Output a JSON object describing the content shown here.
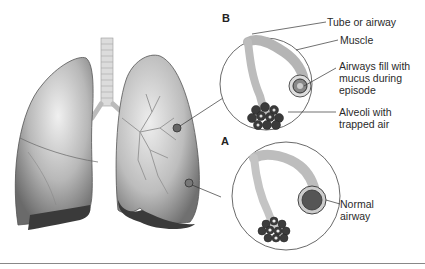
{
  "diagram": {
    "panels": [
      {
        "id": "B",
        "letter": "B",
        "labels": [
          "Tube or airway",
          "Muscle",
          "Airways fill with\nmucus during\nepisode",
          "Alveoli with\ntrapped air"
        ]
      },
      {
        "id": "A",
        "letter": "A",
        "labels": [
          "Normal\nairway"
        ]
      }
    ],
    "colors": {
      "lung_fill": "#bdbdbd",
      "lung_shadow": "#6e6e6e",
      "lung_dark": "#3a3a3a",
      "airway": "#d9d9d9",
      "line": "#333333",
      "rule": "#888888"
    }
  }
}
